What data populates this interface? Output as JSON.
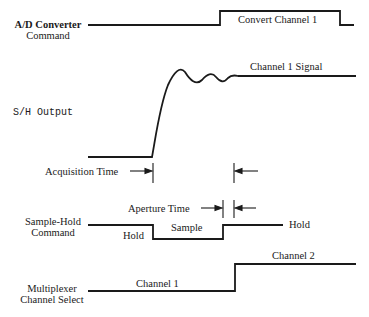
{
  "diagram": {
    "type": "timing-diagram",
    "signals": {
      "ad_command": {
        "label_line1": "A/D Converter",
        "label_line2": "Command",
        "high_label": "Convert Channel 1"
      },
      "sh_output": {
        "label": "S/H Output",
        "settled_label": "Channel 1 Signal"
      },
      "acquisition": {
        "label": "Acquisition Time"
      },
      "sh_command": {
        "label_line1": "Sample-Hold",
        "label_line2": "Command",
        "left_state": "Hold",
        "low_state": "Sample",
        "right_state": "Hold",
        "aperture_label": "Aperture Time"
      },
      "mux": {
        "label_line1": "Multiplexer",
        "label_line2": "Channel Select",
        "low_label": "Channel 1",
        "high_label": "Channel 2"
      }
    },
    "stroke_color": "#1a1a1a",
    "background": "#ffffff"
  }
}
